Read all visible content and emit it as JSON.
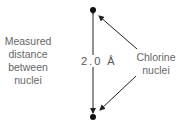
{
  "diagram": {
    "left_label": [
      "Measured",
      "distance",
      "between",
      "nuclei"
    ],
    "right_label": [
      "Chlorine",
      "nuclei"
    ],
    "distance_label": "2.0 Å",
    "nodes": [
      {
        "name": "chlorine-nucleus-top",
        "x": 93,
        "y": 10
      },
      {
        "name": "chlorine-nucleus-bottom",
        "x": 93,
        "y": 117
      }
    ],
    "colors": {
      "line": "#222222",
      "text": "#666666"
    }
  }
}
